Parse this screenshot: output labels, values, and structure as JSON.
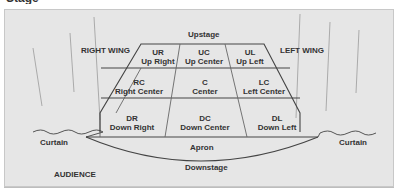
{
  "title_cropped": "Stage Diagram",
  "labels": {
    "upstage": "Upstage",
    "downstage": "Downstage",
    "apron": "Apron",
    "right_wing": "RIGHT WING",
    "left_wing": "LEFT WING",
    "curtain_left": "Curtain",
    "curtain_right": "Curtain",
    "audience": "AUDIENCE"
  },
  "areas": [
    {
      "abbr": "UR",
      "name": "Up Right"
    },
    {
      "abbr": "UC",
      "name": "Up Center"
    },
    {
      "abbr": "UL",
      "name": "Up Left"
    },
    {
      "abbr": "RC",
      "name": "Right Center"
    },
    {
      "abbr": "C",
      "name": "Center"
    },
    {
      "abbr": "LC",
      "name": "Left Center"
    },
    {
      "abbr": "DR",
      "name": "Down Right"
    },
    {
      "abbr": "DC",
      "name": "Down Center"
    },
    {
      "abbr": "DL",
      "name": "Down Left"
    }
  ],
  "colors": {
    "panel": "#e6e6e6",
    "line": "#444444",
    "text": "#333333"
  }
}
